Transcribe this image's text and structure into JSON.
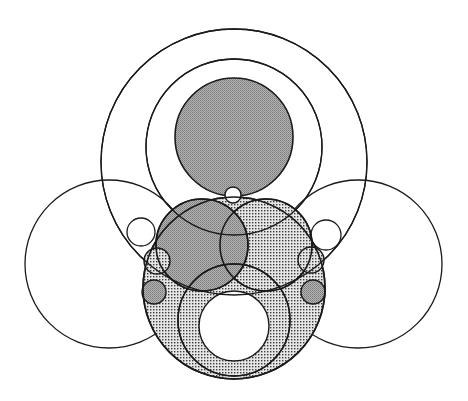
{
  "canvas": {
    "width": 468,
    "height": 401,
    "background": "#ffffff"
  },
  "colors": {
    "stroke": "#1a1a1a",
    "dark_fill": "#a8a8a8",
    "dot_fill": "#d9d9d9",
    "dot": "#333333",
    "white": "#ffffff"
  },
  "diagram": {
    "circles": [
      {
        "id": "outer-ring",
        "cx": 234,
        "cy": 162,
        "r": 133,
        "fill": "none",
        "stroke_width": 1.3
      },
      {
        "id": "left-side-circle",
        "cx": 109,
        "cy": 264,
        "r": 84,
        "fill": "none",
        "stroke_width": 1.3
      },
      {
        "id": "right-side-circle",
        "cx": 358,
        "cy": 264,
        "r": 84,
        "fill": "none",
        "stroke_width": 1.3
      },
      {
        "id": "lower-big-circle",
        "cx": 234,
        "cy": 288,
        "r": 91,
        "fill": "dots",
        "stroke_width": 1.6
      },
      {
        "id": "second-ring",
        "cx": 234,
        "cy": 147,
        "r": 88,
        "fill": "none",
        "stroke_width": 1.3
      },
      {
        "id": "upper-right-dotted",
        "cx": 266,
        "cy": 245,
        "r": 46,
        "fill": "dots",
        "stroke_width": 1.6
      },
      {
        "id": "upper-left-dark",
        "cx": 202,
        "cy": 245,
        "r": 46,
        "fill": "dark",
        "stroke_width": 1.6
      },
      {
        "id": "top-dark-circle",
        "cx": 234,
        "cy": 137,
        "r": 59,
        "fill": "dark",
        "stroke_width": 1.6
      },
      {
        "id": "inner-ring",
        "cx": 234,
        "cy": 320,
        "r": 56,
        "fill": "none",
        "stroke_width": 1.4
      },
      {
        "id": "center-hole",
        "cx": 234,
        "cy": 326,
        "r": 35,
        "fill": "white",
        "stroke_width": 1.4
      },
      {
        "id": "tiny-top-circle",
        "cx": 233,
        "cy": 195,
        "r": 8,
        "fill": "white",
        "stroke_width": 1.4
      },
      {
        "id": "left-small-white",
        "cx": 141,
        "cy": 232,
        "r": 14,
        "fill": "none",
        "stroke_width": 1.3
      },
      {
        "id": "left-small-dotted",
        "cx": 157,
        "cy": 261,
        "r": 13,
        "fill": "dots",
        "stroke_width": 1.4
      },
      {
        "id": "left-small-dark",
        "cx": 154,
        "cy": 292,
        "r": 12,
        "fill": "dark",
        "stroke_width": 1.4
      },
      {
        "id": "right-small-white",
        "cx": 326,
        "cy": 235,
        "r": 15,
        "fill": "none",
        "stroke_width": 1.3
      },
      {
        "id": "right-small-dotted",
        "cx": 311,
        "cy": 260,
        "r": 13,
        "fill": "dots",
        "stroke_width": 1.4
      },
      {
        "id": "right-small-dark",
        "cx": 313,
        "cy": 292,
        "r": 12,
        "fill": "dark",
        "stroke_width": 1.4
      }
    ],
    "arcs_overlay": [
      {
        "id": "outer-ring-overlay",
        "ref": "outer-ring"
      },
      {
        "id": "second-ring-overlay",
        "ref": "second-ring"
      },
      {
        "id": "inner-ring-overlay",
        "ref": "inner-ring"
      },
      {
        "id": "upper-left-overlay",
        "ref": "upper-left-dark"
      },
      {
        "id": "upper-right-overlay",
        "ref": "upper-right-dotted"
      },
      {
        "id": "lower-big-overlay",
        "ref": "lower-big-circle"
      }
    ]
  }
}
